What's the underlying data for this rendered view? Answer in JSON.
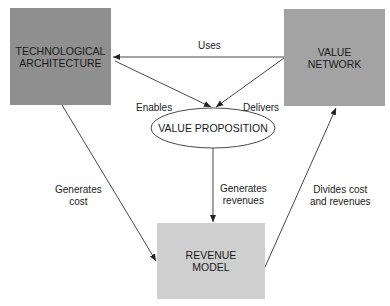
{
  "nodes": {
    "tech_arch": {
      "label": "TECHNOLOGICAL\nARCHITECTURE",
      "color": "#8f8f8f"
    },
    "value_network": {
      "label": "VALUE\nNETWORK",
      "color": "#a3a3a3"
    },
    "value_proposition": {
      "label": "VALUE PROPOSITION",
      "color": "#ffffff"
    },
    "revenue_model": {
      "label": "REVENUE\nMODEL",
      "color": "#cfcfcf"
    }
  },
  "edges": {
    "uses": "Uses",
    "enables": "Enables",
    "delivers": "Delivers",
    "generates_revenues": "Generates\nrevenues",
    "generates_cost": "Generates\ncost",
    "divides": "Divides cost\nand revenues"
  }
}
